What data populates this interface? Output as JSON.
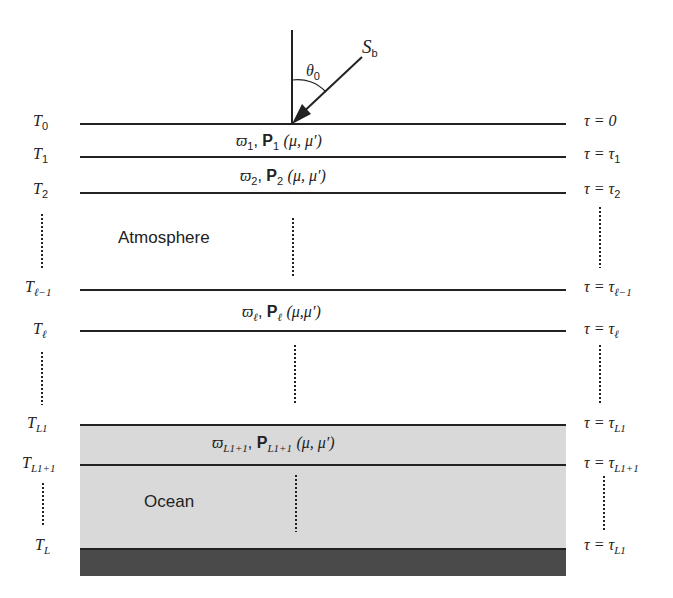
{
  "diagram": {
    "beam": {
      "label_main": "S",
      "label_sub": "b",
      "angle_label": "θ",
      "angle_sub": "0"
    },
    "regions": {
      "atmosphere": "Atmosphere",
      "ocean": "Ocean"
    },
    "left_labels": [
      {
        "main": "T",
        "sub": "0"
      },
      {
        "main": "T",
        "sub": "1"
      },
      {
        "main": "T",
        "sub": "2"
      },
      {
        "main": "T",
        "sub": "ℓ−1"
      },
      {
        "main": "T",
        "sub": "ℓ"
      },
      {
        "main": "T",
        "sub": "L1"
      },
      {
        "main": "T",
        "sub": "L1+1"
      },
      {
        "main": "T",
        "sub": "L"
      }
    ],
    "right_labels": [
      {
        "main": "τ = 0",
        "sub": ""
      },
      {
        "main": "τ = τ",
        "sub": "1"
      },
      {
        "main": "τ = τ",
        "sub": "2"
      },
      {
        "main": "τ = τ",
        "sub": "ℓ−1"
      },
      {
        "main": "τ = τ",
        "sub": "ℓ"
      },
      {
        "main": "τ = τ",
        "sub": "L1"
      },
      {
        "main": "τ = τ",
        "sub": "L1+1"
      },
      {
        "main": "τ = τ",
        "sub": "L1"
      }
    ],
    "layer_labels": [
      {
        "omega": "ϖ",
        "sub": "1",
        "P": "P",
        "args": "(μ, μ′)"
      },
      {
        "omega": "ϖ",
        "sub": "2",
        "P": "P",
        "args": "(μ, μ′)"
      },
      {
        "omega": "ϖ",
        "sub": "ℓ",
        "P": "P",
        "args": "(μ,μ′)"
      },
      {
        "omega": "ϖ",
        "sub": "L1+1",
        "P": "P",
        "args": "(μ, μ′)"
      }
    ],
    "colors": {
      "ocean": "#d9d9d9",
      "bottom": "#4a4a4a",
      "line": "#222222"
    }
  }
}
